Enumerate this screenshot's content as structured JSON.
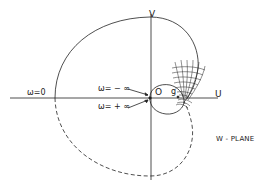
{
  "diagram": {
    "plane_label": "W - PLANE",
    "axes": {
      "horizontal": "U",
      "vertical": "V"
    },
    "annotations": {
      "omega_zero": "ω=0",
      "omega_minus_inf": "ω= − ∞",
      "omega_plus_inf": "ω= + ∞",
      "origin": "O",
      "point_g": "g"
    },
    "colors": {
      "ink": "#222222",
      "background": "#ffffff"
    }
  }
}
